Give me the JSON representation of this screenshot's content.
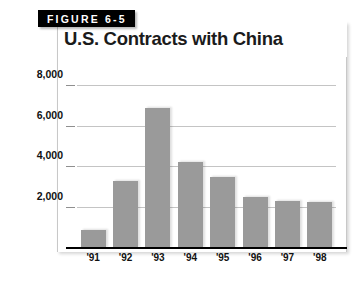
{
  "figure": {
    "label": "FIGURE 6-5"
  },
  "chart_data": {
    "type": "bar",
    "title": "U.S. Contracts with China",
    "xlabel": "",
    "ylabel": "number of contracts",
    "categories": [
      "'91",
      "'92",
      "'93",
      "'94",
      "'95",
      "'96",
      "'97",
      "'98"
    ],
    "values": [
      880,
      3330,
      6900,
      4240,
      3530,
      2540,
      2300,
      2290
    ],
    "ylim": [
      0,
      8400
    ],
    "yticks": [
      2000,
      4000,
      6000,
      8000
    ],
    "ytick_labels": [
      "2,000",
      "4,000",
      "6,000",
      "8,000"
    ],
    "grid": true,
    "legend": false,
    "bar_color": "#9a9a9a",
    "axis_color": "#000000",
    "grid_color": "#c4c4c4"
  }
}
